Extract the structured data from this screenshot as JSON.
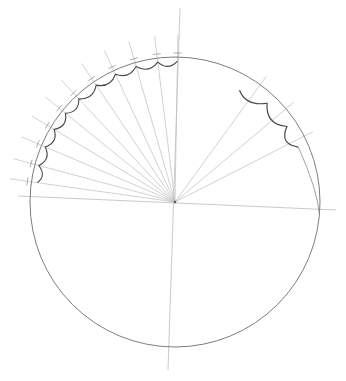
{
  "diagram": {
    "type": "pencil construction sketch",
    "colors": {
      "background": "#ffffff",
      "circle": "#6e6e6e",
      "guides": "#bdbdbd",
      "scallops": "#4a4a4a"
    },
    "center": [
      175,
      202
    ],
    "radius": 145,
    "axes": {
      "vertical": [
        [
          180,
          8
        ],
        [
          168,
          370
        ]
      ],
      "horizontal": [
        [
          18,
          196
        ],
        [
          336,
          210
        ]
      ]
    },
    "left_ray_angles_deg": [
      188,
      195,
      203,
      211,
      219,
      227,
      236,
      245,
      254,
      263,
      271
    ],
    "right_ray_angles_deg": [
      306,
      320,
      333
    ],
    "text_labels": []
  }
}
